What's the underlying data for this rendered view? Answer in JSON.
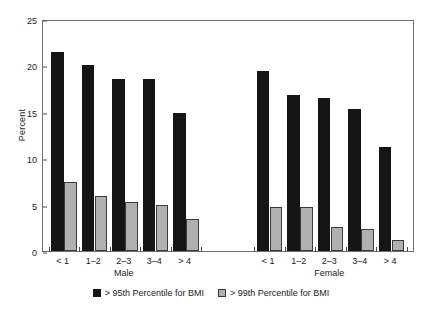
{
  "chart_data": {
    "type": "bar",
    "title": "",
    "subtitle": "",
    "xlabel": "",
    "ylabel": "Percent",
    "ylim": [
      0,
      25
    ],
    "ytick_labels": [
      "0",
      "5",
      "10",
      "15",
      "20",
      "25"
    ],
    "ytick_values": [
      0,
      5,
      10,
      15,
      20,
      25
    ],
    "grid": false,
    "legend_position": "bottom-center",
    "groups": [
      {
        "name": "Male",
        "categories": [
          "< 1",
          "1–2",
          "2–3",
          "3–4",
          "> 4"
        ]
      },
      {
        "name": "Female",
        "categories": [
          "< 1",
          "1–2",
          "2–3",
          "3–4",
          "> 4"
        ]
      }
    ],
    "categories": [
      "< 1",
      "1–2",
      "2–3",
      "3–4",
      "> 4",
      "< 1",
      "1–2",
      "2–3",
      "3–4",
      "> 4"
    ],
    "series": [
      {
        "name": "> 95th Percentile for BMI",
        "color": "#151515",
        "values": [
          21.4,
          20.0,
          18.5,
          18.5,
          14.9,
          19.4,
          16.8,
          16.5,
          15.3,
          11.2
        ]
      },
      {
        "name": "> 99th Percentile for BMI",
        "color": "#b0b0b0",
        "values": [
          7.4,
          5.9,
          5.3,
          5.0,
          3.5,
          4.7,
          4.7,
          2.6,
          2.4,
          1.2
        ]
      }
    ]
  },
  "legend": {
    "items": [
      {
        "label": "> 95th Percentile for BMI",
        "swatch": "dark-swatch"
      },
      {
        "label": "> 99th Percentile for BMI",
        "swatch": "light-swatch"
      }
    ]
  },
  "axis": {
    "y_title": "Percent"
  }
}
